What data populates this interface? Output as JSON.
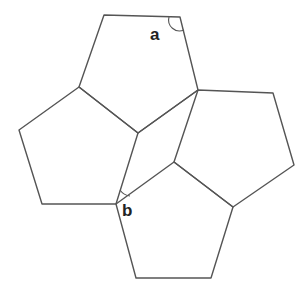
{
  "diagram": {
    "pentagons": [
      {
        "name": "top",
        "points": "104,15 180,17 198,90 138,133 79,87"
      },
      {
        "name": "left",
        "points": "79,87 138,133 116,204 42,204 19,130"
      },
      {
        "name": "right",
        "points": "198,90 273,93 294,165 233,207 174,162"
      },
      {
        "name": "bottom",
        "points": "116,204 174,162 233,207 211,278 136,278"
      }
    ],
    "connectors": [
      {
        "x1": 138,
        "y1": 133,
        "x2": 198,
        "y2": 90
      }
    ],
    "angles": [
      {
        "label": "a",
        "label_x": 150,
        "label_y": 27,
        "arc": "M 169 17 A 11 11 0 0 0 184 30"
      },
      {
        "label": "b",
        "label_x": 122,
        "label_y": 204,
        "arc": "M 120 190 A 14 14 0 0 0 129 196"
      }
    ],
    "stroke_color": "#555555"
  }
}
